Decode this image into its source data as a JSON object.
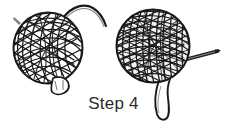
{
  "illustration": {
    "title": "Step 4",
    "caption_label": "Step 4",
    "step_number": "4",
    "subject": "yarn-ball-winding-instruction",
    "background_color": "#ffffff",
    "ink_color": "#1a1a1a",
    "caption_color": "#2b2b2b",
    "objects": [
      {
        "name": "loose-yarn-ball",
        "position": "left",
        "description": "Loosely wound ball of yarn with open criss-cross strands and visible gaps",
        "density": "loose",
        "center_x": 48,
        "center_y": 48,
        "radius_x": 35,
        "radius_y": 36,
        "has_trailing_strand": true,
        "has_tied_end": true
      },
      {
        "name": "dense-yarn-ball",
        "position": "right",
        "description": "Tightly wound dark ball of yarn with a needle inserted and a hanging strand loop",
        "density": "dense",
        "center_x": 153,
        "center_y": 46,
        "radius_x": 37,
        "radius_y": 37,
        "has_needle": true,
        "has_hanging_loop": true
      },
      {
        "name": "trailing-yarn-strand",
        "description": "Curved loose yarn tail leaving the top-right of the left ball",
        "attached_to": "loose-yarn-ball"
      },
      {
        "name": "knot-tail-left",
        "description": "Small flared tied-off yarn end at the bottom of the left ball",
        "attached_to": "loose-yarn-ball"
      },
      {
        "name": "needle",
        "description": "Thin pointed needle protruding to the right of the dense ball",
        "attached_to": "dense-yarn-ball",
        "angle_deg": -12
      },
      {
        "name": "hanging-yarn-loop",
        "description": "Long narrow yarn loop hanging down from the bottom of the dense ball",
        "attached_to": "dense-yarn-ball"
      }
    ]
  }
}
